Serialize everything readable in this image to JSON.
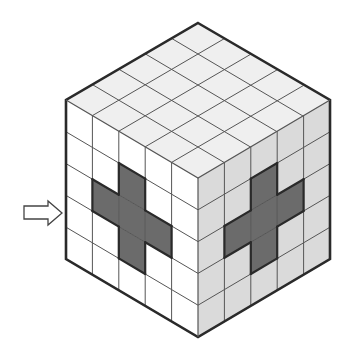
{
  "diagram": {
    "title": "5x5x5 cube with cross pattern on two faces",
    "grid_size": 5,
    "colors": {
      "background": "#ffffff",
      "top_face": "#efefef",
      "left_face": "#ffffff",
      "right_face": "#dadada",
      "cross_fill": "#6b6b6b",
      "grid_line": "#555555",
      "outline": "#2a2a2a",
      "arrow_fill": "#ffffff",
      "arrow_stroke": "#444444"
    },
    "vertices": {
      "top": [
        198,
        23
      ],
      "left": [
        66,
        100
      ],
      "right": [
        330,
        100
      ],
      "front": [
        198,
        178
      ],
      "bottom_left": [
        66,
        259
      ],
      "bottom_right": [
        330,
        259
      ],
      "bottom": [
        198,
        337
      ]
    },
    "faces": {
      "left": {
        "name": "front-left-face",
        "cross_cells": [
          [
            2,
            1
          ],
          [
            1,
            2
          ],
          [
            2,
            2
          ],
          [
            3,
            2
          ],
          [
            2,
            3
          ]
        ]
      },
      "right": {
        "name": "front-right-face",
        "cross_cells": [
          [
            2,
            1
          ],
          [
            1,
            2
          ],
          [
            2,
            2
          ],
          [
            3,
            2
          ],
          [
            2,
            3
          ]
        ]
      }
    },
    "arrow": {
      "direction": "right",
      "points_to": "front-left-face",
      "shaft": {
        "x1": 24,
        "x2": 48,
        "y_top": 206,
        "y_bottom": 219
      },
      "head": {
        "x_base": 48,
        "tip_x": 62,
        "tip_y": 213,
        "y_top": 201,
        "y_bottom": 225
      }
    }
  }
}
